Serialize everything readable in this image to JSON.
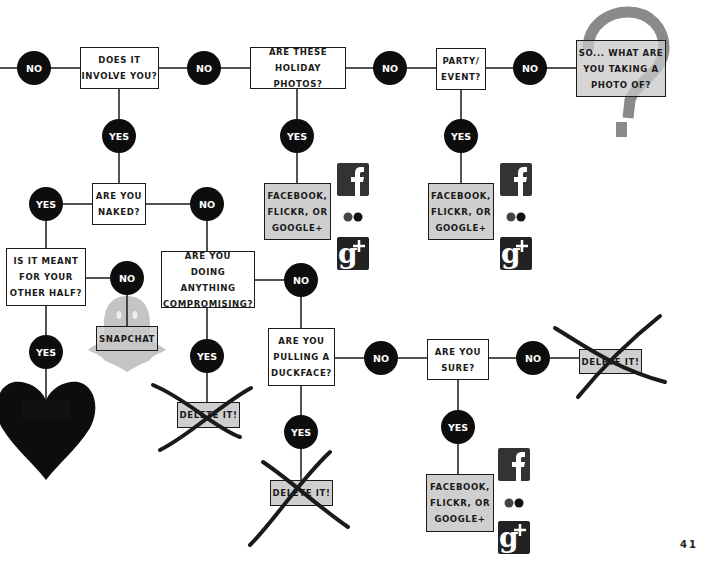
{
  "page_number": "41",
  "colors": {
    "node_fill": "#0d0d0d",
    "node_text": "#ffffff",
    "box_border": "#1a1a1a",
    "result_box_fill": "#cfcfcf",
    "question_mark": "#8a8a8a",
    "ghost": "#bdbdbd",
    "cross_stroke": "#1a1a1a"
  },
  "questions": {
    "involve_you": "DOES IT\nINVOLVE YOU?",
    "holiday_photos": "ARE THESE\nHOLIDAY PHOTOS?",
    "party_event": "PARTY/\nEVENT?",
    "what_photo": "SO... WHAT ARE\nYOU TAKING A\nPHOTO OF?",
    "naked": "ARE YOU\nNAKED?",
    "other_half": "IS IT MEANT\nFOR YOUR\nOTHER HALF?",
    "compromising": "ARE YOU\nDOING ANYTHING\nCOMPROMISING?",
    "duckface": "ARE YOU\nPULLING A\nDUCKFACE?",
    "sure": "ARE YOU\nSURE?"
  },
  "outcomes": {
    "social_1": "FACEBOOK,\nFLICKR, OR\nGOOGLE+",
    "social_2": "FACEBOOK,\nFLICKR, OR\nGOOGLE+",
    "social_3": "FACEBOOK,\nFLICKR, OR\nGOOGLE+",
    "snapchat": "SNAPCHAT",
    "delete_1": "DELETE IT!",
    "delete_2": "DELETE IT!",
    "delete_3": "DELETE IT!"
  },
  "nodes": {
    "no": "NO",
    "yes": "YES"
  },
  "icons": [
    "facebook-icon",
    "flickr-icon",
    "google-plus-icon",
    "question-mark-icon",
    "snapchat-ghost-icon",
    "heart-icon",
    "cross-out-icon"
  ]
}
